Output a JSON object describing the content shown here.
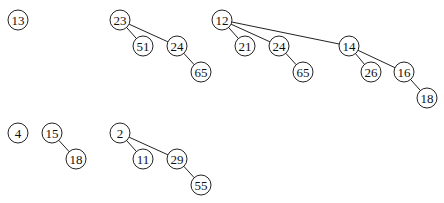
{
  "diagram": {
    "type": "binomial-heap-forest",
    "node_radius": 10,
    "colors": {
      "stroke": "#222222",
      "fill": "#ffffff",
      "text": "#111111",
      "background": "#ffffff"
    },
    "heaps": [
      {
        "name": "heap-top",
        "trees": [
          {
            "root": "13",
            "nodes": [
              {
                "id": "t1n13",
                "label": "13",
                "x": 18,
                "y": 20
              }
            ],
            "edges": []
          },
          {
            "root": "23",
            "nodes": [
              {
                "id": "t2n23",
                "label": "23",
                "x": 120,
                "y": 20
              },
              {
                "id": "t2n51",
                "label": "51",
                "x": 143,
                "y": 46
              },
              {
                "id": "t2n24",
                "label": "24",
                "x": 177,
                "y": 46
              },
              {
                "id": "t2n65",
                "label": "65",
                "x": 201,
                "y": 72
              }
            ],
            "edges": [
              [
                "t2n23",
                "t2n51"
              ],
              [
                "t2n23",
                "t2n24"
              ],
              [
                "t2n24",
                "t2n65"
              ]
            ]
          },
          {
            "root": "12",
            "nodes": [
              {
                "id": "t3n12",
                "label": "12",
                "x": 222,
                "y": 20
              },
              {
                "id": "t3n21",
                "label": "21",
                "x": 245,
                "y": 46
              },
              {
                "id": "t3n24",
                "label": "24",
                "x": 279,
                "y": 46
              },
              {
                "id": "t3n65",
                "label": "65",
                "x": 303,
                "y": 72
              },
              {
                "id": "t3n14",
                "label": "14",
                "x": 349,
                "y": 46
              },
              {
                "id": "t3n26",
                "label": "26",
                "x": 371,
                "y": 72
              },
              {
                "id": "t3n16",
                "label": "16",
                "x": 404,
                "y": 72
              },
              {
                "id": "t3n18",
                "label": "18",
                "x": 427,
                "y": 98
              }
            ],
            "edges": [
              [
                "t3n12",
                "t3n21"
              ],
              [
                "t3n12",
                "t3n24"
              ],
              [
                "t3n24",
                "t3n65"
              ],
              [
                "t3n12",
                "t3n14"
              ],
              [
                "t3n14",
                "t3n26"
              ],
              [
                "t3n14",
                "t3n16"
              ],
              [
                "t3n16",
                "t3n18"
              ]
            ]
          }
        ]
      },
      {
        "name": "heap-bottom",
        "trees": [
          {
            "root": "4",
            "nodes": [
              {
                "id": "b1n4",
                "label": "4",
                "x": 18,
                "y": 133
              }
            ],
            "edges": []
          },
          {
            "root": "15",
            "nodes": [
              {
                "id": "b2n15",
                "label": "15",
                "x": 52,
                "y": 133
              },
              {
                "id": "b2n18",
                "label": "18",
                "x": 76,
                "y": 159
              }
            ],
            "edges": [
              [
                "b2n15",
                "b2n18"
              ]
            ]
          },
          {
            "root": "2",
            "nodes": [
              {
                "id": "b3n2",
                "label": "2",
                "x": 120,
                "y": 133
              },
              {
                "id": "b3n11",
                "label": "11",
                "x": 143,
                "y": 159
              },
              {
                "id": "b3n29",
                "label": "29",
                "x": 177,
                "y": 159
              },
              {
                "id": "b3n55",
                "label": "55",
                "x": 201,
                "y": 185
              }
            ],
            "edges": [
              [
                "b3n2",
                "b3n11"
              ],
              [
                "b3n2",
                "b3n29"
              ],
              [
                "b3n29",
                "b3n55"
              ]
            ]
          }
        ]
      }
    ]
  }
}
